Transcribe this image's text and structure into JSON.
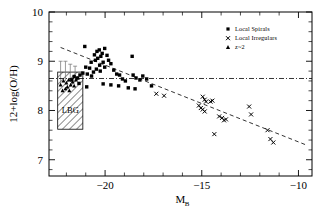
{
  "figure": {
    "background": "#ffffff",
    "foreground": "#000000"
  },
  "axes": {
    "x": {
      "label_main": "M",
      "label_sub": "B",
      "ticks": [
        -20,
        -15,
        -10
      ],
      "tick_labels": [
        "−20",
        "−15",
        "−10"
      ],
      "range": [
        -22.9,
        -9.3
      ],
      "minor_step": 1
    },
    "y": {
      "label": "12+log(O/H)",
      "ticks": [
        7,
        8,
        9,
        10
      ],
      "tick_labels": [
        "7",
        "8",
        "9",
        "10"
      ],
      "range": [
        6.67,
        10.0
      ],
      "minor_step": 0.2
    }
  },
  "legend": {
    "position": "top-right",
    "items": [
      {
        "marker": "square",
        "label": "Local Spirals"
      },
      {
        "marker": "cross",
        "label": "Local Irregulars"
      },
      {
        "marker": "triangle",
        "label": "z~2"
      }
    ]
  },
  "annotations": {
    "lbg_box": {
      "label": "LBG",
      "x_range": [
        -22.45,
        -21.15
      ],
      "y_range": [
        7.62,
        8.78
      ],
      "hatch": "diagonal"
    },
    "hline": {
      "style": "dash-dot",
      "y_value": 8.65
    },
    "trend_dashed": {
      "style": "dashed",
      "x_from": -22.3,
      "x_to": -9.6,
      "y_from": 9.28,
      "y_to": 7.3
    }
  },
  "chart_data": {
    "type": "scatter",
    "title": "",
    "xlabel": "M_B",
    "ylabel": "12+log(O/H)",
    "xlim": [
      -22.9,
      -9.3
    ],
    "ylim": [
      6.67,
      10.0
    ],
    "grid": false,
    "legend_position": "top-right",
    "series": [
      {
        "name": "Local Spirals",
        "marker": "square",
        "color": "#000000",
        "points": [
          [
            -21.05,
            9.3
          ],
          [
            -20.55,
            9.13
          ],
          [
            -20.42,
            9.2
          ],
          [
            -20.3,
            9.23
          ],
          [
            -20.72,
            8.98
          ],
          [
            -20.5,
            9.02
          ],
          [
            -20.38,
            9.06
          ],
          [
            -20.22,
            9.1
          ],
          [
            -20.15,
            9.16
          ],
          [
            -20.02,
            9.26
          ],
          [
            -19.9,
            9.12
          ],
          [
            -20.1,
            8.98
          ],
          [
            -20.28,
            8.92
          ],
          [
            -20.02,
            8.88
          ],
          [
            -19.82,
            9.02
          ],
          [
            -19.7,
            8.95
          ],
          [
            -20.45,
            8.84
          ],
          [
            -20.25,
            8.8
          ],
          [
            -20.6,
            8.78
          ],
          [
            -20.8,
            8.86
          ],
          [
            -21.0,
            8.88
          ],
          [
            -20.92,
            8.74
          ],
          [
            -20.7,
            8.7
          ],
          [
            -21.15,
            8.76
          ],
          [
            -21.3,
            8.72
          ],
          [
            -21.45,
            8.66
          ],
          [
            -21.6,
            8.69
          ],
          [
            -21.72,
            8.62
          ],
          [
            -19.55,
            8.82
          ],
          [
            -19.4,
            8.74
          ],
          [
            -19.25,
            8.72
          ],
          [
            -19.1,
            8.64
          ],
          [
            -18.95,
            8.6
          ],
          [
            -18.6,
            9.1
          ],
          [
            -18.55,
            8.72
          ],
          [
            -18.4,
            8.66
          ],
          [
            -18.2,
            8.62
          ],
          [
            -18.05,
            8.7
          ],
          [
            -17.85,
            8.64
          ],
          [
            -19.3,
            8.5
          ],
          [
            -19.7,
            8.52
          ],
          [
            -20.1,
            8.54
          ],
          [
            -20.95,
            8.48
          ],
          [
            -21.35,
            8.55
          ],
          [
            -18.8,
            8.46
          ],
          [
            -18.45,
            8.44
          ],
          [
            -17.6,
            8.5
          ]
        ]
      },
      {
        "name": "Local Irregulars",
        "marker": "cross",
        "color": "#000000",
        "points": [
          [
            -17.35,
            8.34
          ],
          [
            -16.95,
            8.3
          ],
          [
            -15.15,
            8.1
          ],
          [
            -15.05,
            8.05
          ],
          [
            -14.95,
            8.28
          ],
          [
            -14.85,
            8.22
          ],
          [
            -14.78,
            8.18
          ],
          [
            -14.95,
            8.02
          ],
          [
            -14.85,
            7.98
          ],
          [
            -14.55,
            8.18
          ],
          [
            -14.45,
            8.2
          ],
          [
            -13.95,
            7.85
          ],
          [
            -13.85,
            7.8
          ],
          [
            -13.75,
            7.82
          ],
          [
            -14.1,
            7.88
          ],
          [
            -14.35,
            7.52
          ],
          [
            -12.45,
            7.92
          ],
          [
            -12.55,
            8.08
          ],
          [
            -11.6,
            7.6
          ],
          [
            -11.45,
            7.42
          ],
          [
            -11.3,
            7.35
          ]
        ]
      },
      {
        "name": "z~2",
        "marker": "triangle",
        "color": "#000000",
        "points": [
          [
            -22.15,
            8.6
          ],
          [
            -22.0,
            8.56
          ],
          [
            -21.88,
            8.62
          ],
          [
            -21.95,
            8.48
          ],
          [
            -22.05,
            8.44
          ],
          [
            -21.78,
            8.52
          ],
          [
            -21.68,
            8.58
          ],
          [
            -21.6,
            8.5
          ],
          [
            -22.2,
            8.4
          ],
          [
            -21.85,
            8.4
          ],
          [
            -21.5,
            8.62
          ],
          [
            -21.4,
            8.66
          ],
          [
            -22.3,
            8.52
          ]
        ]
      }
    ],
    "reference_lines": [
      {
        "name": "luminosity-metallicity-relation",
        "style": "dashed",
        "points": [
          [
            -22.3,
            9.28
          ],
          [
            -9.6,
            7.3
          ]
        ]
      },
      {
        "name": "solar-metallicity",
        "style": "dash-dot",
        "y": 8.65
      }
    ],
    "regions": [
      {
        "name": "LBG",
        "label": "LBG",
        "x": [
          -22.45,
          -21.15
        ],
        "y": [
          7.62,
          8.78
        ]
      }
    ]
  }
}
